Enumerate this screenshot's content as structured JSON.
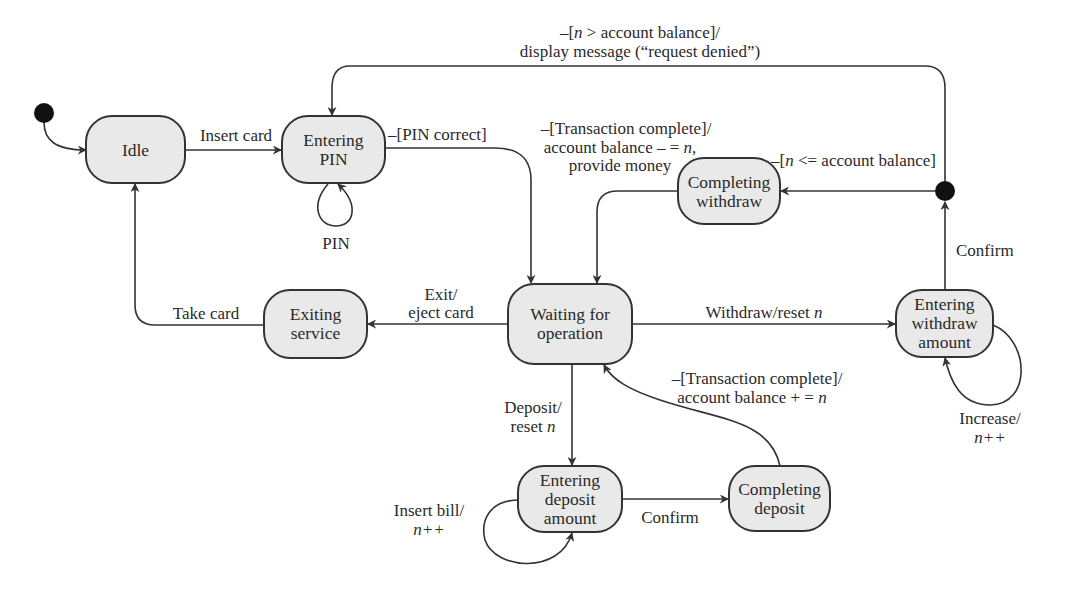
{
  "diagram": {
    "type": "UML state machine",
    "pseudostates": {
      "initial": {
        "label": "initial-state"
      },
      "decision": {
        "label": "withdraw-decision"
      }
    },
    "states": {
      "idle": {
        "lines": [
          "Idle"
        ]
      },
      "entering_pin": {
        "lines": [
          "Entering",
          "PIN"
        ]
      },
      "completing_withdraw": {
        "lines": [
          "Completing",
          "withdraw"
        ]
      },
      "waiting": {
        "lines": [
          "Waiting for",
          "operation"
        ]
      },
      "exiting": {
        "lines": [
          "Exiting",
          "service"
        ]
      },
      "entering_withdraw": {
        "lines": [
          "Entering",
          "withdraw",
          "amount"
        ]
      },
      "entering_deposit": {
        "lines": [
          "Entering",
          "deposit",
          "amount"
        ]
      },
      "completing_deposit": {
        "lines": [
          "Completing",
          "deposit"
        ]
      }
    },
    "transitions": {
      "insert_card": "Insert card",
      "pin_loop": "PIN",
      "pin_correct": "–[PIN correct]",
      "denied": {
        "line1_pre": "–[",
        "line1_var": "n",
        "line1_post": " > account balance]/",
        "line2": "display message (“request denied”)"
      },
      "withdraw_complete": {
        "line1": "–[Transaction complete]/",
        "line2_pre": "account balance – = ",
        "line2_var": "n",
        "line2_post": ",",
        "line3": "provide money"
      },
      "allowed": {
        "pre": "–[",
        "var": "n",
        "post": " <= account balance]"
      },
      "confirm_withdraw": "Confirm",
      "exit": {
        "line1": "Exit/",
        "line2": "eject card"
      },
      "take_card": "Take card",
      "withdraw": {
        "pre": "Withdraw/reset ",
        "var": "n"
      },
      "deposit": {
        "line1": "Deposit/",
        "line2_pre": "reset ",
        "line2_var": "n"
      },
      "deposit_complete": {
        "line1": "–[Transaction complete]/",
        "line2_pre": "account balance + = ",
        "line2_var": "n"
      },
      "increase": {
        "line1": "Increase/",
        "line2": "n++"
      },
      "insert_bill": {
        "line1": "Insert bill/",
        "line2": "n++"
      },
      "confirm_deposit": "Confirm"
    },
    "colors": {
      "state_fill": "#e9e9e9",
      "stroke": "#333333",
      "text": "#2a2a2a",
      "background": "#ffffff"
    }
  }
}
